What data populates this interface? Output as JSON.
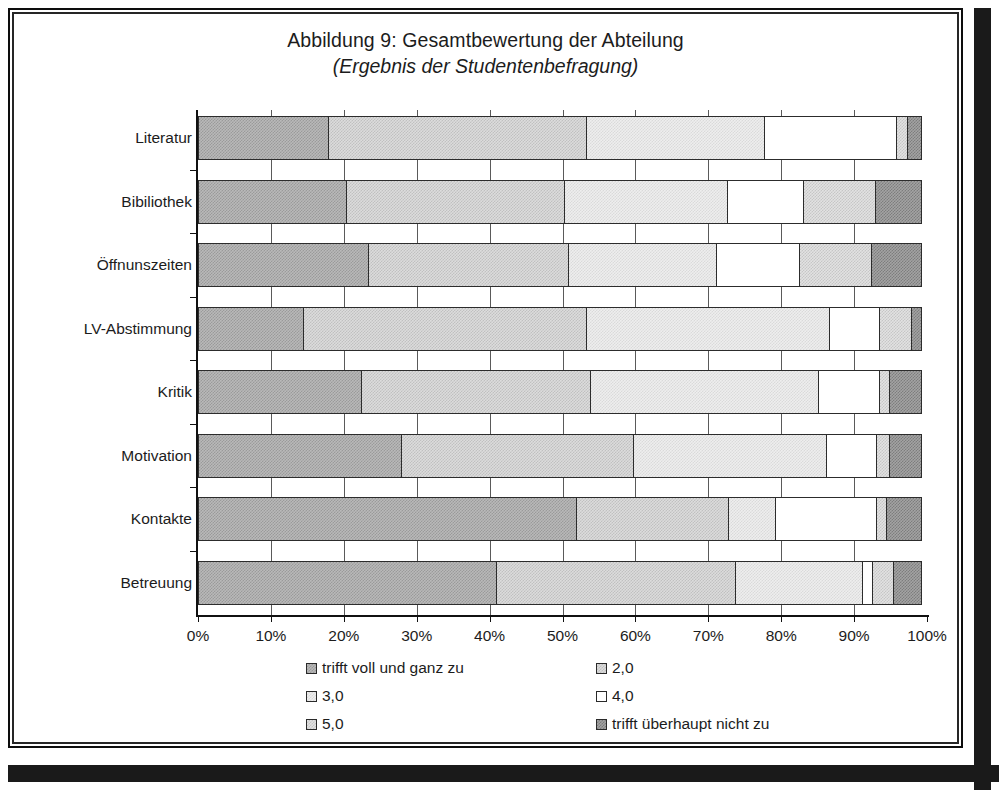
{
  "chart_data": {
    "type": "bar",
    "orientation": "horizontal",
    "stacked": true,
    "normalized_percent": true,
    "title": "Abbildung 9: Gesamtbewertung der Abteilung",
    "subtitle": "(Ergebnis der Studentenbefragung)",
    "xlabel": "",
    "ylabel": "",
    "xlim": [
      0,
      100
    ],
    "grid": true,
    "legend_position": "bottom",
    "x_tick_labels": [
      "0%",
      "10%",
      "20%",
      "30%",
      "40%",
      "50%",
      "60%",
      "70%",
      "80%",
      "90%",
      "100%"
    ],
    "x_tick_values": [
      0,
      10,
      20,
      30,
      40,
      50,
      60,
      70,
      80,
      90,
      100
    ],
    "categories": [
      "Literatur",
      "Bibiliothek",
      "Öffnunszeiten",
      "LV-Abstimmung",
      "Kritik",
      "Motivation",
      "Kontakte",
      "Betreuung"
    ],
    "series": [
      {
        "name": "trifft voll und ganz zu",
        "fill": "f1",
        "values": [
          18.0,
          20.5,
          23.5,
          14.5,
          22.5,
          28.0,
          52.0,
          41.0
        ]
      },
      {
        "name": "2,0",
        "fill": "f2",
        "values": [
          35.5,
          30.0,
          27.5,
          39.0,
          31.5,
          32.0,
          21.0,
          33.0
        ]
      },
      {
        "name": "3,0",
        "fill": "f3",
        "values": [
          24.5,
          22.5,
          20.5,
          33.5,
          31.5,
          26.5,
          6.5,
          17.5
        ]
      },
      {
        "name": "4,0",
        "fill": "f4",
        "values": [
          18.3,
          10.5,
          11.5,
          7.0,
          8.5,
          7.0,
          14.0,
          1.5
        ]
      },
      {
        "name": "5,0",
        "fill": "f5",
        "values": [
          1.7,
          10.0,
          10.0,
          4.5,
          1.5,
          2.0,
          1.5,
          3.0
        ]
      },
      {
        "name": "trifft überhaupt nicht zu",
        "fill": "f6",
        "values": [
          2.0,
          6.5,
          7.0,
          1.5,
          4.5,
          4.5,
          5.0,
          4.0
        ]
      }
    ]
  },
  "legend": {
    "items": [
      {
        "label": "trifft voll und ganz zu",
        "fill": "f1",
        "col": 0,
        "row": 0
      },
      {
        "label": "2,0",
        "fill": "f2",
        "col": 1,
        "row": 0
      },
      {
        "label": "3,0",
        "fill": "f3",
        "col": 0,
        "row": 1
      },
      {
        "label": "4,0",
        "fill": "f4",
        "col": 1,
        "row": 1
      },
      {
        "label": "5,0",
        "fill": "f5",
        "col": 0,
        "row": 2
      },
      {
        "label": "trifft überhaupt nicht zu",
        "fill": "f6",
        "col": 1,
        "row": 2
      }
    ]
  },
  "colors": {
    "frame": "#0d0d0d",
    "shadow": "#1a1a1a",
    "text": "#1c1c1c",
    "axis": "#111111",
    "gridline": "#5a5a5a",
    "segment_border": "#2c2c2c"
  }
}
